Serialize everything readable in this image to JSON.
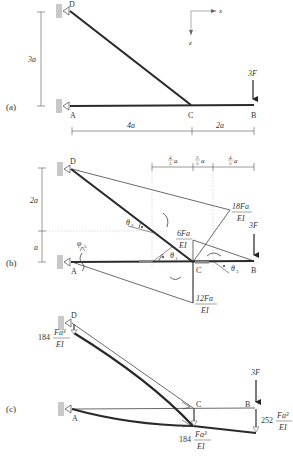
{
  "figure": {
    "panels": [
      {
        "id": "a",
        "label": "(a)"
      },
      {
        "id": "b",
        "label": "(b)"
      },
      {
        "id": "c",
        "label": "(c)"
      }
    ],
    "axes": {
      "x": "x",
      "z": "z"
    },
    "nodes": {
      "A": "A",
      "B": "B",
      "C": "C",
      "D": "D"
    },
    "panel_a": {
      "height_dim": "3a",
      "span_AC": "4a",
      "span_CB": "2a",
      "load": "3F"
    },
    "panel_b": {
      "height_upper": "2a",
      "height_lower": "a",
      "top_dims": [
        {
          "num": "4",
          "den": "3",
          "unit": "a"
        },
        {
          "num": "2",
          "den": "3",
          "unit": "a"
        },
        {
          "num": "4",
          "den": "3",
          "unit": "a"
        }
      ],
      "moment_DC": {
        "num": "18Fa",
        "den": "EI"
      },
      "moment_C_top": {
        "num": "6Fa",
        "den": "EI"
      },
      "moment_C_bottom": {
        "num": "12Fa",
        "den": "EI"
      },
      "load": "3F",
      "phi": "φ",
      "phi_sub": "A",
      "theta1": "θ",
      "theta1_sub": "1",
      "theta2": "θ",
      "theta2_sub": "2",
      "theta3": "θ",
      "theta3_sub": "3"
    },
    "panel_c": {
      "load": "3F",
      "defl_D": {
        "coef": "184",
        "num": "Fa³",
        "den": "EI"
      },
      "defl_C": {
        "coef": "184",
        "num": "Fa³",
        "den": "EI"
      },
      "defl_B": {
        "coef": "252",
        "num": "Fa³",
        "den": "EI"
      }
    }
  }
}
